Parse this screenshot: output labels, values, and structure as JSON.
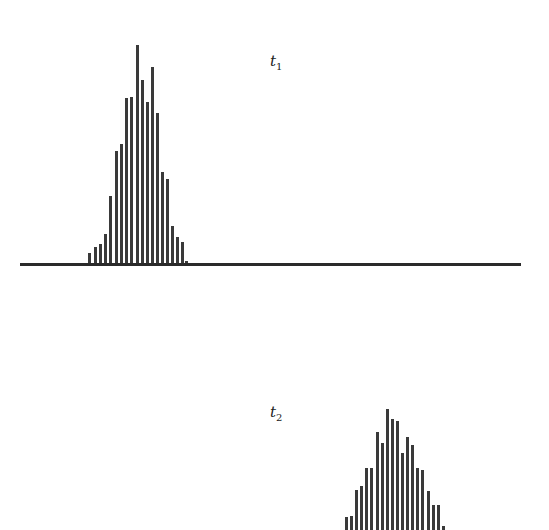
{
  "chart_data": [
    {
      "type": "bar",
      "title": "t1",
      "label_main": "t",
      "label_sub": "1",
      "xlabel": "",
      "ylabel": "",
      "grid": false,
      "legend": "none",
      "baseline": {
        "x_start": 20,
        "x_end": 521,
        "y": 264
      },
      "bar_x": [
        89,
        95,
        100,
        105,
        110,
        116,
        121,
        126,
        131,
        137,
        142,
        147,
        152,
        157,
        162,
        167,
        172,
        177,
        182,
        186
      ],
      "values": [
        11,
        17,
        20,
        30,
        68,
        113,
        120,
        166,
        167,
        219,
        184,
        162,
        197,
        151,
        92,
        85,
        38,
        27,
        22,
        3
      ]
    },
    {
      "type": "bar",
      "title": "t2",
      "label_main": "t",
      "label_sub": "2",
      "xlabel": "",
      "ylabel": "",
      "grid": false,
      "legend": "none",
      "baseline": {
        "y": 530
      },
      "bar_x": [
        346,
        351,
        356,
        361,
        366,
        371,
        377,
        382,
        387,
        392,
        397,
        402,
        407,
        412,
        417,
        422,
        428,
        433,
        438,
        443
      ],
      "values": [
        13,
        14,
        40,
        44,
        62,
        62,
        98,
        87,
        121,
        111,
        109,
        77,
        93,
        85,
        62,
        60,
        39,
        25,
        25,
        4
      ]
    }
  ],
  "labels": {
    "t1": {
      "main": "t",
      "sub": "1"
    },
    "t2": {
      "main": "t",
      "sub": "2"
    }
  }
}
